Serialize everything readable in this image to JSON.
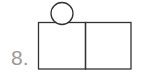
{
  "problem": {
    "number_label": "8."
  },
  "figure": {
    "stroke_color": "#333333",
    "shapes": [
      {
        "type": "rect",
        "name": "left-square"
      },
      {
        "type": "rect",
        "name": "right-square"
      },
      {
        "type": "circle",
        "name": "top-circle"
      }
    ]
  }
}
